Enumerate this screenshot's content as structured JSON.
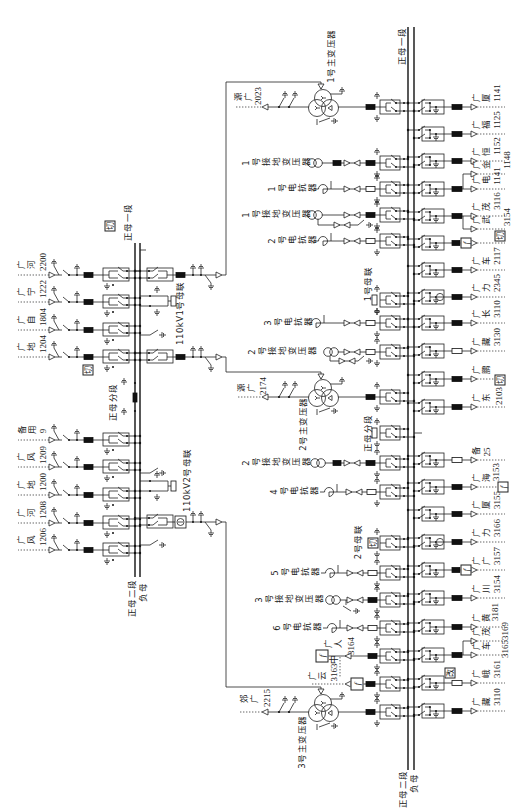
{
  "colors": {
    "line": "#222222",
    "background": "#ffffff"
  },
  "symbols": {
    "cut": "切",
    "f": "f",
    "change": "改"
  },
  "kv110": {
    "bus_top_label": "正母一段",
    "bus_bottom_main_label": "正母二段",
    "bus_bottom_neg_label": "负母",
    "section_label": "正母分段",
    "coupler_1_label": "110kV1号母联",
    "coupler_2_label": "110kV2号母联",
    "feeders": [
      {
        "name": "广河",
        "number": "2200"
      },
      {
        "name": "广宁",
        "number": "1222"
      },
      {
        "name": "广自",
        "number": "1804"
      },
      {
        "name": "广地",
        "number": "1204"
      },
      {
        "name": "备用",
        "number": "9"
      },
      {
        "name": "广风",
        "number": "1209"
      },
      {
        "name": "广地",
        "number": "1200"
      },
      {
        "name": "广河",
        "number": "1208"
      },
      {
        "name": "广风",
        "number": "1206"
      }
    ]
  },
  "main_transformers": [
    {
      "label": "1号主变压器",
      "source_name": "源广",
      "source_number": "2023"
    },
    {
      "label": "2号主变压器",
      "source_name": "源广",
      "source_number": "2174"
    },
    {
      "label": "3号主变压器",
      "source_name": "郊广",
      "source_number": "2215"
    }
  ],
  "kv10": {
    "bus_top_label": "正母一段",
    "bus_bottom_main_label": "正母二段",
    "bus_bottom_neg_label": "负母",
    "section_label": "正母分段",
    "coupler_1_label": "1号母联",
    "coupler_2_label": "2号母联",
    "equipment": [
      {
        "label": "1号接地变压器"
      },
      {
        "label": "1号电抗器"
      },
      {
        "label": "1号接地变压器"
      },
      {
        "label": "2号电抗器"
      },
      {
        "label": "3号电抗器"
      },
      {
        "label": "2号接地变压器"
      },
      {
        "label": "2号接地变压器"
      },
      {
        "label": "4号电抗器"
      },
      {
        "label": "5号电抗器"
      },
      {
        "label": "3号接地变压器"
      },
      {
        "label": "6号电抗器"
      }
    ],
    "local_feeders": [
      {
        "name": "广人",
        "number": "3164"
      },
      {
        "name": "广云",
        "number": "3163中"
      }
    ],
    "feeders": [
      {
        "name": "广厦",
        "number": "1141"
      },
      {
        "name": "广福",
        "number": "1125"
      },
      {
        "name": "广恒",
        "number": "1152"
      },
      {
        "name": "广金",
        "number": "1148"
      },
      {
        "name": "广电",
        "number": "1141"
      },
      {
        "name": "广茂",
        "number": "3116"
      },
      {
        "name": "广武",
        "number": "3154"
      },
      {
        "name": "广车",
        "number": "2117"
      },
      {
        "name": "广力",
        "number": "2345"
      },
      {
        "name": "广长",
        "number": "3110"
      },
      {
        "name": "广藏",
        "number": "3130"
      },
      {
        "name": "广鹏"
      },
      {
        "name": "广东",
        "number": "2103"
      },
      {
        "name": "备",
        "number": "25"
      },
      {
        "name": "广海",
        "number": "3153"
      },
      {
        "name": "广厦",
        "number": "3155"
      },
      {
        "name": "广力",
        "number": "3166"
      },
      {
        "name": "广广",
        "number": "3157"
      },
      {
        "name": "广川",
        "number": "3154"
      },
      {
        "name": "广黄",
        "number": "3181"
      },
      {
        "name": "广茂"
      },
      {
        "name": "广车",
        "number": "31653169"
      },
      {
        "name": "广峨",
        "number": "3161"
      },
      {
        "name": "广藏",
        "number": "3110"
      }
    ]
  }
}
